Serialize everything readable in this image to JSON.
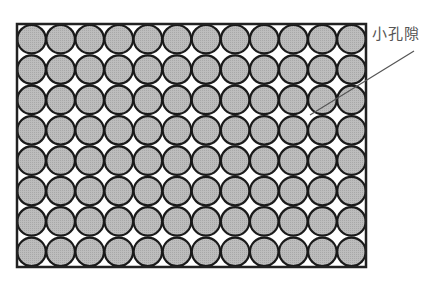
{
  "figure": {
    "type": "packed-circles-pore-diagram",
    "grid": {
      "columns": 12,
      "rows": 8
    },
    "frame": {
      "x": 17,
      "y": 24,
      "width": 349,
      "height": 243
    },
    "colors": {
      "circle_fill": "#b9b9b9",
      "circle_stroke": "#1a1a1a",
      "frame_stroke": "#222222",
      "background": "#ffffff",
      "leader_line": "#555555"
    },
    "annotation": {
      "label": "小孔隙",
      "leader": {
        "x1": 414,
        "y1": 51,
        "x2": 310,
        "y2": 115
      }
    }
  }
}
